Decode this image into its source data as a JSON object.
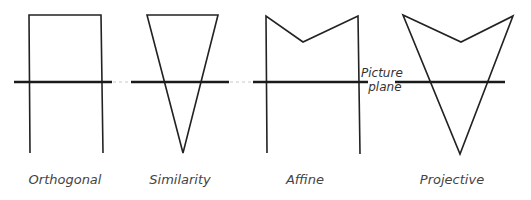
{
  "diagram": {
    "picture_plane_label_line1": "Picture",
    "picture_plane_label_line2": "plane",
    "figures": [
      {
        "label": "Orthogonal"
      },
      {
        "label": "Similarity"
      },
      {
        "label": "Affine"
      },
      {
        "label": "Projective"
      }
    ]
  }
}
